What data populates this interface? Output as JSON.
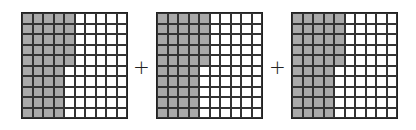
{
  "figure": {
    "rows": 10,
    "cols": 10,
    "shade_color": "#a9a9a9",
    "operator": "+",
    "grids": [
      {
        "full_cols": 4,
        "partial_col_cells": 5,
        "shaded_total": 45
      },
      {
        "full_cols": 4,
        "partial_col_cells": 5,
        "shaded_total": 45
      },
      {
        "full_cols": 4,
        "partial_col_cells": 5,
        "shaded_total": 45
      }
    ]
  }
}
